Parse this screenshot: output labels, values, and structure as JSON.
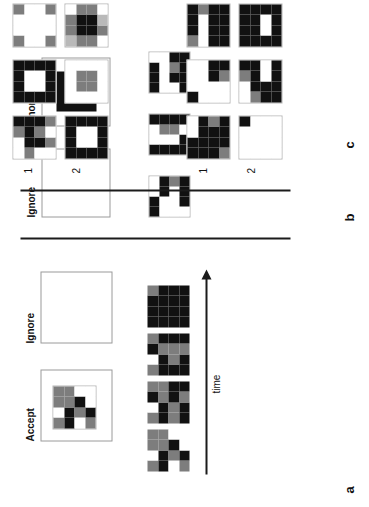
{
  "figure": {
    "panels": [
      {
        "id": "a",
        "label": "a"
      },
      {
        "id": "b",
        "label": "b"
      },
      {
        "id": "c",
        "label": "c"
      },
      {
        "id": "d",
        "label": "d"
      }
    ],
    "colors": {
      "black": "#111111",
      "dark_gray": "#3c3c3c",
      "mid_gray": "#7d7d7d",
      "light_gray": "#b9b9b9",
      "white": "#ffffff",
      "frame_stroke": "#9a9a9a",
      "divider": "#1b1b1b"
    }
  },
  "panel_a": {
    "letter": "a",
    "accept_label": "Accept",
    "ignore_label": "Ignore",
    "time_label": "time",
    "accept_grid": {
      "rows": 4,
      "cols": 4,
      "cells": [
        [
          "mid_gray",
          "white",
          "mid_gray",
          "mid_gray"
        ],
        [
          "black",
          "black",
          "mid_gray",
          "mid_gray"
        ],
        [
          "white",
          "mid_gray",
          "black",
          "white"
        ],
        [
          "mid_gray",
          "black",
          "white",
          "white"
        ]
      ]
    },
    "ignore_grid": null,
    "sequence": [
      {
        "index": 1,
        "rows": 4,
        "cols": 4,
        "cells": [
          [
            "mid_gray",
            "white",
            "mid_gray",
            "mid_gray"
          ],
          [
            "black",
            "black",
            "mid_gray",
            "mid_gray"
          ],
          [
            "white",
            "mid_gray",
            "black",
            "white"
          ],
          [
            "mid_gray",
            "black",
            "white",
            "white"
          ]
        ]
      },
      {
        "index": 2,
        "rows": 4,
        "cols": 4,
        "cells": [
          [
            "mid_gray",
            "white",
            "black",
            "mid_gray"
          ],
          [
            "black",
            "black",
            "mid_gray",
            "mid_gray"
          ],
          [
            "mid_gray",
            "mid_gray",
            "black",
            "black"
          ],
          [
            "black",
            "black",
            "mid_gray",
            "black"
          ]
        ]
      },
      {
        "index": 3,
        "rows": 4,
        "cols": 4,
        "cells": [
          [
            "mid_gray",
            "white",
            "black",
            "mid_gray"
          ],
          [
            "black",
            "black",
            "mid_gray",
            "black"
          ],
          [
            "black",
            "mid_gray",
            "mid_gray",
            "black"
          ],
          [
            "black",
            "black",
            "mid_gray",
            "black"
          ]
        ]
      },
      {
        "index": 4,
        "rows": 4,
        "cols": 4,
        "cells": [
          [
            "black",
            "black",
            "black",
            "mid_gray"
          ],
          [
            "black",
            "black",
            "black",
            "black"
          ],
          [
            "black",
            "black",
            "black",
            "black"
          ],
          [
            "black",
            "black",
            "black",
            "black"
          ]
        ]
      }
    ]
  },
  "panel_b": {
    "letter": "b",
    "ignore_label_1": "Ignore",
    "ignore_label_2": "Ignore",
    "empty_frame": {
      "filled": false
    },
    "filled_frame": {
      "filled": true
    },
    "grids": [
      {
        "index": 1,
        "rows": 4,
        "cols": 4,
        "cells": [
          [
            "black",
            "black",
            "white",
            "white"
          ],
          [
            "white",
            "white",
            "black",
            "black"
          ],
          [
            "white",
            "white",
            "white",
            "mid_gray"
          ],
          [
            "white",
            "black",
            "black",
            "black"
          ]
        ]
      },
      {
        "index": 2,
        "rows": 4,
        "cols": 4,
        "cells": [
          [
            "black",
            "white",
            "white",
            "black"
          ],
          [
            "black",
            "white",
            "mid_gray",
            "black"
          ],
          [
            "black",
            "white",
            "mid_gray",
            "black"
          ],
          [
            "black",
            "black",
            "white",
            "black"
          ]
        ]
      },
      {
        "index": 3,
        "rows": 4,
        "cols": 4,
        "cells": [
          [
            "black",
            "black",
            "black",
            "white"
          ],
          [
            "white",
            "white",
            "white",
            "white"
          ],
          [
            "white",
            "black",
            "mid_gray",
            "black"
          ],
          [
            "black",
            "black",
            "black",
            "black"
          ]
        ]
      }
    ]
  },
  "panel_c": {
    "letter": "c",
    "column_labels": [
      "1",
      "2"
    ],
    "row1": [
      {
        "index": 1,
        "rows": 4,
        "cols": 4,
        "cells": [
          [
            "black",
            "black",
            "white",
            "white"
          ],
          [
            "black",
            "black",
            "black",
            "black"
          ],
          [
            "black",
            "black",
            "black",
            "mid_gray"
          ],
          [
            "mid_gray",
            "black",
            "black",
            "black"
          ]
        ]
      },
      {
        "index": 2,
        "rows": 4,
        "cols": 4,
        "cells": [
          [
            "black",
            "white",
            "white",
            "white"
          ],
          [
            "white",
            "white",
            "white",
            "white"
          ],
          [
            "white",
            "white",
            "black",
            "black"
          ],
          [
            "white",
            "white",
            "mid_gray",
            "black"
          ]
        ]
      },
      {
        "index": 3,
        "rows": 4,
        "cols": 4,
        "cells": [
          [
            "mid_gray",
            "black",
            "black",
            "black"
          ],
          [
            "white",
            "white",
            "white",
            "mid_gray"
          ],
          [
            "black",
            "black",
            "black",
            "black"
          ],
          [
            "black",
            "black",
            "black",
            "black"
          ]
        ]
      }
    ],
    "row2": [
      {
        "index": 1,
        "rows": 4,
        "cols": 4,
        "cells": [
          [
            "white",
            "white",
            "white",
            "black"
          ],
          [
            "white",
            "white",
            "white",
            "white"
          ],
          [
            "white",
            "white",
            "white",
            "white"
          ],
          [
            "white",
            "white",
            "white",
            "white"
          ]
        ]
      },
      {
        "index": 2,
        "rows": 4,
        "cols": 4,
        "cells": [
          [
            "white",
            "white",
            "mid_gray",
            "black"
          ],
          [
            "mid_gray",
            "black",
            "black",
            "black"
          ],
          [
            "black",
            "black",
            "white",
            "white"
          ],
          [
            "black",
            "black",
            "black",
            "black"
          ]
        ]
      },
      {
        "index": 3,
        "rows": 4,
        "cols": 4,
        "cells": [
          [
            "black",
            "black",
            "black",
            "black"
          ],
          [
            "black",
            "black",
            "black",
            "black"
          ],
          [
            "black",
            "white",
            "white",
            "black"
          ],
          [
            "black",
            "black",
            "black",
            "black"
          ]
        ]
      }
    ]
  },
  "panel_d": {
    "letter": "d",
    "column_labels": [
      "1",
      "2"
    ],
    "row1": [
      {
        "index": 1,
        "rows": 4,
        "cols": 4,
        "cells": [
          [
            "white",
            "white",
            "mid_gray",
            "black"
          ],
          [
            "mid_gray",
            "black",
            "black",
            "black"
          ],
          [
            "white",
            "black",
            "mid_gray",
            "black"
          ],
          [
            "white",
            "mid_gray",
            "white",
            "mid_gray"
          ]
        ]
      },
      {
        "index": 2,
        "rows": 4,
        "cols": 4,
        "cells": [
          [
            "black",
            "black",
            "black",
            "black"
          ],
          [
            "black",
            "white",
            "white",
            "black"
          ],
          [
            "black",
            "white",
            "white",
            "black"
          ],
          [
            "black",
            "black",
            "black",
            "black"
          ]
        ]
      },
      {
        "index": 3,
        "rows": 4,
        "cols": 4,
        "cells": [
          [
            "mid_gray",
            "white",
            "white",
            "mid_gray"
          ],
          [
            "white",
            "white",
            "white",
            "white"
          ],
          [
            "white",
            "white",
            "white",
            "white"
          ],
          [
            "mid_gray",
            "white",
            "white",
            "mid_gray"
          ]
        ]
      }
    ],
    "row2": [
      {
        "index": 1,
        "rows": 4,
        "cols": 4,
        "cells": [
          [
            "black",
            "black",
            "black",
            "black"
          ],
          [
            "black",
            "white",
            "white",
            "black"
          ],
          [
            "black",
            "white",
            "white",
            "black"
          ],
          [
            "black",
            "black",
            "black",
            "black"
          ]
        ]
      },
      {
        "index": 2,
        "rows": 4,
        "cols": 4,
        "cells": [
          [
            "white",
            "white",
            "white",
            "white"
          ],
          [
            "white",
            "mid_gray",
            "mid_gray",
            "white"
          ],
          [
            "white",
            "mid_gray",
            "mid_gray",
            "white"
          ],
          [
            "white",
            "white",
            "white",
            "white"
          ]
        ]
      },
      {
        "index": 3,
        "rows": 4,
        "cols": 4,
        "cells": [
          [
            "light_gray",
            "mid_gray",
            "mid_gray",
            "white"
          ],
          [
            "mid_gray",
            "black",
            "black",
            "mid_gray"
          ],
          [
            "mid_gray",
            "black",
            "black",
            "mid_gray"
          ],
          [
            "white",
            "mid_gray",
            "light_gray",
            "white"
          ]
        ]
      }
    ]
  }
}
